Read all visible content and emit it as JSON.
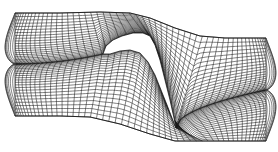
{
  "figure": {
    "line_color": "#1a1a1a",
    "boundary_color": "#555555",
    "background": "#ffffff"
  },
  "geometry": {
    "inlet_block": {
      "x": 15,
      "top": 13,
      "bottom": 116
    },
    "outlet_block": {
      "x": 266,
      "top": 38,
      "bottom": 141
    },
    "top_boundary": [
      [
        15,
        13
      ],
      [
        60,
        13
      ],
      [
        100,
        12
      ],
      [
        130,
        13
      ],
      [
        150,
        18
      ],
      [
        175,
        28
      ],
      [
        200,
        36
      ],
      [
        225,
        38
      ],
      [
        266,
        38
      ]
    ],
    "bottom_boundary": [
      [
        15,
        116
      ],
      [
        60,
        116
      ],
      [
        90,
        117
      ],
      [
        120,
        124
      ],
      [
        150,
        134
      ],
      [
        175,
        141
      ],
      [
        210,
        141
      ],
      [
        266,
        141
      ]
    ],
    "airfoil_suction_side": [
      [
        103,
        54
      ],
      [
        106,
        46
      ],
      [
        113,
        40
      ],
      [
        122,
        36
      ],
      [
        133,
        33
      ],
      [
        143,
        33
      ],
      [
        150,
        36
      ],
      [
        155,
        45
      ],
      [
        160,
        60
      ],
      [
        165,
        80
      ],
      [
        170,
        100
      ],
      [
        174,
        118
      ],
      [
        176,
        128
      ]
    ],
    "airfoil_pressure_side": [
      [
        103,
        54
      ],
      [
        110,
        54
      ],
      [
        120,
        51
      ],
      [
        130,
        50
      ],
      [
        140,
        53
      ],
      [
        148,
        62
      ],
      [
        155,
        75
      ],
      [
        161,
        90
      ],
      [
        167,
        105
      ],
      [
        172,
        118
      ],
      [
        176,
        128
      ]
    ]
  },
  "mesh": {
    "streamwise_lines": 46,
    "cross_lines": 30
  }
}
